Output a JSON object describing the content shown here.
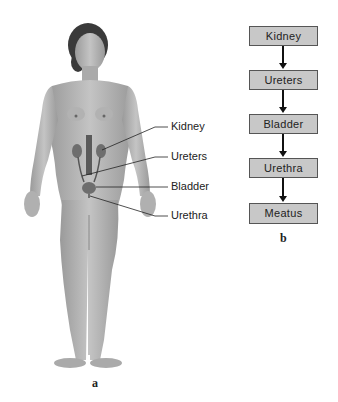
{
  "panel_a": {
    "caption": "a",
    "labels": [
      "Kidney",
      "Ureters",
      "Bladder",
      "Urethra"
    ]
  },
  "panel_b": {
    "caption": "b",
    "flow": [
      "Kidney",
      "Ureters",
      "Bladder",
      "Urethra",
      "Meatus"
    ]
  },
  "colors": {
    "box_fill": "#c8c8c8",
    "box_border": "#555555",
    "skin": "#b5b5b5",
    "organ": "#6e6e6e"
  }
}
